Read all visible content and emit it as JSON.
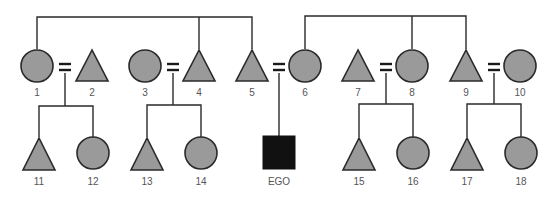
{
  "diagram": {
    "type": "kinship-chart",
    "colors": {
      "shape_fill": "#9a9a9a",
      "ego_fill": "#111111",
      "stroke": "#2a2a2a",
      "label": "#555555"
    },
    "generation1": [
      {
        "id": "1",
        "label": "1",
        "shape": "circle",
        "sex": "female",
        "cx": 37,
        "cy": 66
      },
      {
        "id": "2",
        "label": "2",
        "shape": "triangle",
        "sex": "male",
        "cx": 92,
        "cy": 66
      },
      {
        "id": "3",
        "label": "3",
        "shape": "circle",
        "sex": "female",
        "cx": 145,
        "cy": 66
      },
      {
        "id": "4",
        "label": "4",
        "shape": "triangle",
        "sex": "male",
        "cx": 199,
        "cy": 66
      },
      {
        "id": "5",
        "label": "5",
        "shape": "triangle",
        "sex": "male",
        "cx": 252,
        "cy": 66
      },
      {
        "id": "6",
        "label": "6",
        "shape": "circle",
        "sex": "female",
        "cx": 305,
        "cy": 66
      },
      {
        "id": "7",
        "label": "7",
        "shape": "triangle",
        "sex": "male",
        "cx": 358,
        "cy": 66
      },
      {
        "id": "8",
        "label": "8",
        "shape": "circle",
        "sex": "female",
        "cx": 412,
        "cy": 66
      },
      {
        "id": "9",
        "label": "9",
        "shape": "triangle",
        "sex": "male",
        "cx": 466,
        "cy": 66
      },
      {
        "id": "10",
        "label": "10",
        "shape": "circle",
        "sex": "female",
        "cx": 520,
        "cy": 66
      }
    ],
    "generation2": [
      {
        "id": "11",
        "label": "11",
        "shape": "triangle",
        "sex": "male",
        "cx": 39,
        "cy": 153
      },
      {
        "id": "12",
        "label": "12",
        "shape": "circle",
        "sex": "female",
        "cx": 93,
        "cy": 153
      },
      {
        "id": "13",
        "label": "13",
        "shape": "triangle",
        "sex": "male",
        "cx": 147,
        "cy": 153
      },
      {
        "id": "14",
        "label": "14",
        "shape": "circle",
        "sex": "female",
        "cx": 201,
        "cy": 153
      },
      {
        "id": "ego",
        "label": "EGO",
        "shape": "square",
        "sex": "male",
        "cx": 279,
        "cy": 153
      },
      {
        "id": "15",
        "label": "15",
        "shape": "triangle",
        "sex": "male",
        "cx": 359,
        "cy": 153
      },
      {
        "id": "16",
        "label": "16",
        "shape": "circle",
        "sex": "female",
        "cx": 413,
        "cy": 153
      },
      {
        "id": "17",
        "label": "17",
        "shape": "triangle",
        "sex": "male",
        "cx": 467,
        "cy": 153
      },
      {
        "id": "18",
        "label": "18",
        "shape": "circle",
        "sex": "female",
        "cx": 521,
        "cy": 153
      }
    ],
    "marriages": [
      {
        "spouses": [
          "1",
          "2"
        ],
        "symbol": "=",
        "children": [
          "11",
          "12"
        ]
      },
      {
        "spouses": [
          "3",
          "4"
        ],
        "symbol": "=",
        "children": [
          "13",
          "14"
        ]
      },
      {
        "spouses": [
          "5",
          "6"
        ],
        "symbol": "=",
        "children": [
          "ego"
        ]
      },
      {
        "spouses": [
          "7",
          "8"
        ],
        "symbol": "=",
        "children": [
          "15",
          "16"
        ]
      },
      {
        "spouses": [
          "9",
          "10"
        ],
        "symbol": "=",
        "children": [
          "17",
          "18"
        ]
      }
    ],
    "sibling_groups": [
      {
        "members": [
          "1",
          "4",
          "5"
        ]
      },
      {
        "members": [
          "6",
          "8",
          "9"
        ]
      }
    ]
  }
}
